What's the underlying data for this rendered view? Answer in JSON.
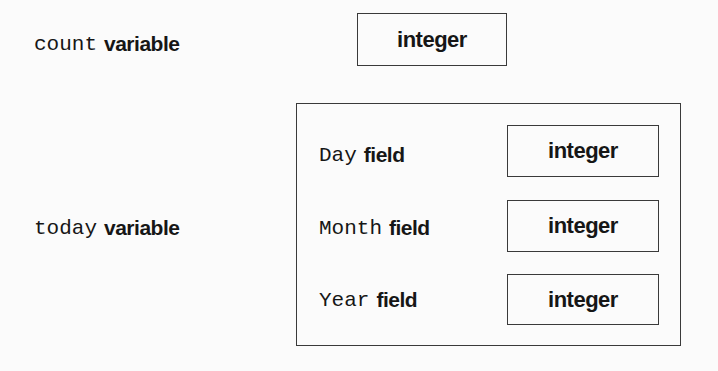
{
  "diagram": {
    "count": {
      "name": "count",
      "kind": "variable",
      "type": "integer"
    },
    "today": {
      "name": "today",
      "kind": "variable",
      "fields": [
        {
          "name": "Day",
          "kind": "field",
          "type": "integer"
        },
        {
          "name": "Month",
          "kind": "field",
          "type": "integer"
        },
        {
          "name": "Year",
          "kind": "field",
          "type": "integer"
        }
      ]
    }
  },
  "colors": {
    "background": "#fbfbfb",
    "ink": "#161616",
    "border": "#3a3a3a"
  }
}
